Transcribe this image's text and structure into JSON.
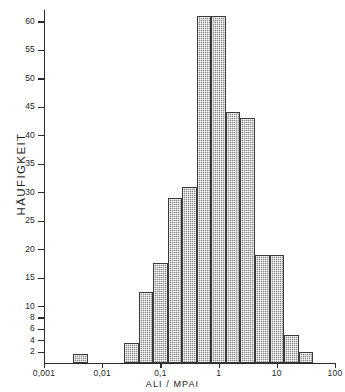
{
  "chart_data": {
    "type": "bar",
    "title": "",
    "subtitle": "",
    "xlabel": "ALI / MPAI",
    "ylabel": "HÄUFIGKEIT",
    "x_scale": "log",
    "xlim": [
      0.001,
      100
    ],
    "ylim": [
      0,
      62
    ],
    "grid": false,
    "legend": null,
    "x_tick_labels": [
      "0,001",
      "0,01",
      "0,1",
      "1",
      "10",
      "100"
    ],
    "x_tick_values": [
      0.001,
      0.01,
      0.1,
      1,
      10,
      100
    ],
    "y_tick_labels": [
      "2",
      "4",
      "6",
      "8",
      "10",
      "15",
      "20",
      "25",
      "30",
      "35",
      "40",
      "45",
      "50",
      "55",
      "60"
    ],
    "y_tick_values": [
      2,
      4,
      6,
      8,
      10,
      15,
      20,
      25,
      30,
      35,
      40,
      45,
      50,
      55,
      60
    ],
    "bin_width_decades": 0.25,
    "categories": [
      "0.0032-0.0056",
      "0.0237-0.0422",
      "0.0422-0.075",
      "0.075-0.133",
      "0.133-0.237",
      "0.237-0.422",
      "0.422-0.75",
      "0.75-1.33",
      "1.33-2.37",
      "2.37-4.22",
      "4.22-7.5",
      "7.5-13.3",
      "13.3-23.7",
      "23.7-42.2"
    ],
    "bin_left_edges": [
      0.00316,
      0.02371,
      0.04217,
      0.07499,
      0.13335,
      0.23714,
      0.4217,
      0.74989,
      1.33352,
      2.37137,
      4.21697,
      7.49894,
      13.33521,
      23.71374
    ],
    "bin_right_edges": [
      0.00562,
      0.04217,
      0.07499,
      0.13335,
      0.23714,
      0.4217,
      0.74989,
      1.33352,
      2.37137,
      4.21697,
      7.49894,
      13.33521,
      23.71374,
      42.16965
    ],
    "values": [
      1.5,
      3.5,
      12.5,
      17.5,
      29,
      31,
      61,
      61,
      44,
      43,
      19,
      19,
      5,
      2
    ]
  },
  "axes": {
    "y_title": "HÄUFIGKEIT",
    "x_title": "ALI / MPAI"
  }
}
